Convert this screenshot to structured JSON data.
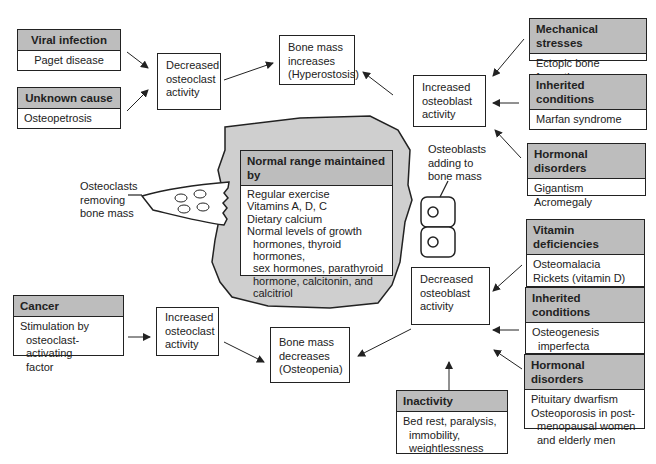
{
  "center": {
    "title": "Normal range maintained by",
    "lines": [
      "Regular exercise",
      "Vitamins A, D, C",
      "Dietary calcium",
      "Normal levels of growth",
      "hormones, thyroid hormones,",
      "sex hormones, parathyroid",
      "hormone, calcitonin, and",
      "calcitriol"
    ]
  },
  "labels": {
    "osteoclasts": [
      "Osteoclasts",
      "removing",
      "bone mass"
    ],
    "osteoblasts": [
      "Osteoblasts",
      "adding to",
      "bone mass"
    ]
  },
  "process": {
    "decreased_osteoclast": [
      "Decreased",
      "osteoclast",
      "activity"
    ],
    "bone_increase": [
      "Bone mass",
      "increases",
      "(Hyperostosis)"
    ],
    "increased_osteoblast": [
      "Increased",
      "osteoblast",
      "activity"
    ],
    "decreased_osteoblast": [
      "Decreased",
      "osteoblast",
      "activity"
    ],
    "increased_osteoclast": [
      "Increased",
      "osteoclast",
      "activity"
    ],
    "bone_decrease": [
      "Bone mass",
      "decreases",
      "(Osteopenia)"
    ]
  },
  "causes": {
    "viral": {
      "title": "Viral infection",
      "lines": [
        "Paget disease"
      ]
    },
    "unknown": {
      "title": "Unknown cause",
      "lines": [
        "Osteopetrosis"
      ]
    },
    "mechanical": {
      "title": "Mechanical stresses",
      "lines": [
        "Ectopic bone formation"
      ]
    },
    "inherited_up": {
      "title": "Inherited conditions",
      "lines": [
        "Marfan syndrome"
      ]
    },
    "hormonal_up": {
      "title": "Hormonal disorders",
      "lines": [
        "Gigantism",
        "Acromegaly"
      ]
    },
    "vitamin": {
      "title": "Vitamin deficiencies",
      "lines": [
        "Osteomalacia",
        "Rickets (vitamin D)",
        "Scurvy (vitamin C)"
      ]
    },
    "inherited_down": {
      "title": "Inherited conditions",
      "lines": [
        "Osteogenesis",
        "imperfecta",
        "Achondroplasia"
      ]
    },
    "hormonal_down": {
      "title": "Hormonal disorders",
      "lines": [
        "Pituitary dwarfism",
        "Osteoporosis in post-",
        "menopausal women",
        "and elderly men"
      ]
    },
    "cancer": {
      "title": "Cancer",
      "lines": [
        "Stimulation by",
        "osteoclast-activating",
        "factor"
      ]
    },
    "inactivity": {
      "title": "Inactivity",
      "lines": [
        "Bed rest, paralysis,",
        "immobility,",
        "weightlessness"
      ]
    }
  },
  "colors": {
    "bone_fill": "#cfcfcf",
    "header_fill": "#bdbdbd",
    "line": "#222222"
  }
}
